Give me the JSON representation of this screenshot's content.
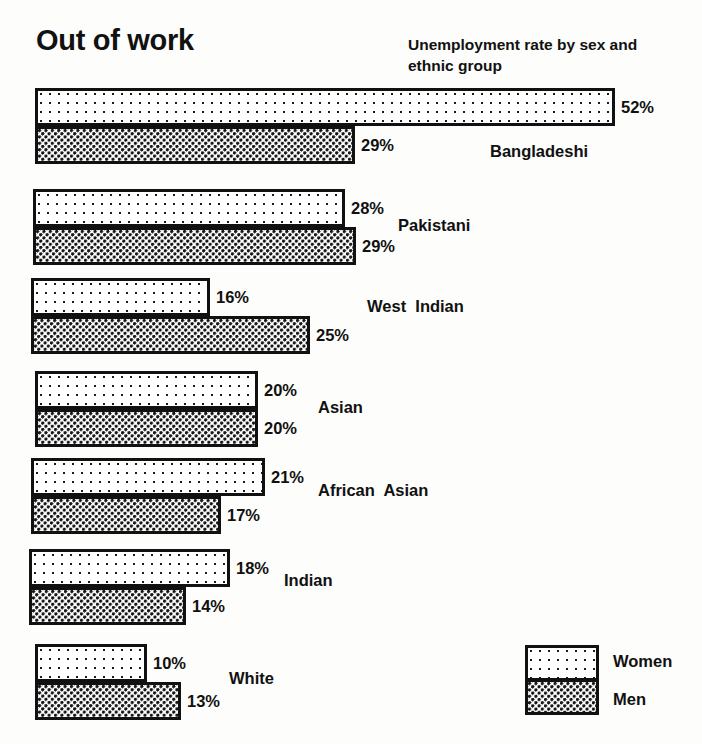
{
  "chart_data": {
    "type": "bar",
    "orientation": "horizontal",
    "title": "Out of work",
    "subtitle": "Unemployment rate by sex and ethnic group",
    "xlabel": "",
    "ylabel": "",
    "unit": "%",
    "xlim": [
      0,
      52
    ],
    "grid": false,
    "legend_position": "bottom-right",
    "categories": [
      "Bangladeshi",
      "Pakistani",
      "West  Indian",
      "Asian",
      "African  Asian",
      "Indian",
      "White"
    ],
    "series": [
      {
        "name": "Women",
        "values": [
          52,
          28,
          16,
          20,
          21,
          18,
          10
        ]
      },
      {
        "name": "Men",
        "values": [
          29,
          29,
          25,
          20,
          17,
          14,
          13
        ]
      }
    ],
    "value_labels": {
      "women": [
        "52%",
        "28%",
        "16%",
        "20%",
        "21%",
        "18%",
        "10%"
      ],
      "men": [
        "29%",
        "29%",
        "25%",
        "20%",
        "17%",
        "14%",
        "13%"
      ]
    }
  },
  "groups": [
    {
      "label": "Bangladeshi",
      "top": 88,
      "left": 35,
      "label_left": 490,
      "label_top": 142,
      "women": {
        "value": 52,
        "text": "52%",
        "width": 580
      },
      "men": {
        "value": 29,
        "text": "29%",
        "width": 320
      }
    },
    {
      "label": "Pakistani",
      "top": 189,
      "left": 33,
      "label_left": 398,
      "label_top": 216,
      "women": {
        "value": 28,
        "text": "28%",
        "width": 312
      },
      "men": {
        "value": 29,
        "text": "29%",
        "width": 323
      }
    },
    {
      "label": "West  Indian",
      "top": 278,
      "left": 31,
      "label_left": 367,
      "label_top": 297,
      "women": {
        "value": 16,
        "text": "16%",
        "width": 179
      },
      "men": {
        "value": 25,
        "text": "25%",
        "width": 279
      }
    },
    {
      "label": "Asian",
      "top": 371,
      "left": 35,
      "label_left": 318,
      "label_top": 398,
      "women": {
        "value": 20,
        "text": "20%",
        "width": 223
      },
      "men": {
        "value": 20,
        "text": "20%",
        "width": 223
      }
    },
    {
      "label": "African  Asian",
      "top": 458,
      "left": 31,
      "label_left": 318,
      "label_top": 481,
      "women": {
        "value": 21,
        "text": "21%",
        "width": 234
      },
      "men": {
        "value": 17,
        "text": "17%",
        "width": 190
      }
    },
    {
      "label": "Indian",
      "top": 549,
      "left": 29,
      "label_left": 284,
      "label_top": 571,
      "women": {
        "value": 18,
        "text": "18%",
        "width": 201
      },
      "men": {
        "value": 14,
        "text": "14%",
        "width": 157
      }
    },
    {
      "label": "White",
      "top": 644,
      "left": 35,
      "label_left": 229,
      "label_top": 669,
      "women": {
        "value": 10,
        "text": "10%",
        "width": 112
      },
      "men": {
        "value": 13,
        "text": "13%",
        "width": 146
      }
    }
  ],
  "legend": {
    "women_label": "Women",
    "men_label": "Men"
  },
  "colors": {
    "ink": "#111111",
    "paper": "#fdfdfb"
  }
}
